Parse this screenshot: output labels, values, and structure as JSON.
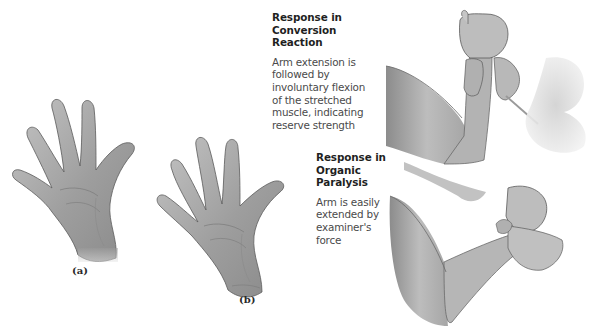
{
  "figure": {
    "panels": [
      {
        "label": "(a)",
        "subject": "open-hand-palm-left"
      },
      {
        "label": "(b)",
        "subject": "open-hand-palm-spread"
      }
    ],
    "responses": [
      {
        "title_lines": [
          "Response in",
          "Conversion",
          "Reaction"
        ],
        "body_lines": [
          "Arm extension is",
          "followed by",
          "involuntary flexion",
          "of the stretched",
          "muscle, indicating",
          "reserve strength"
        ]
      },
      {
        "title_lines": [
          "Response in",
          "Organic",
          "Paralysis"
        ],
        "body_lines": [
          "Arm is easily",
          "extended by",
          "examiner's",
          "force"
        ]
      }
    ],
    "colors": {
      "background": "#ffffff",
      "skin_light": "#d9d9d9",
      "skin_mid": "#a8a8a8",
      "skin_dark": "#7d7d7d",
      "outline": "#5a5a5a",
      "title_text": "#1f1f1f",
      "body_text": "#4a4a4a"
    }
  }
}
